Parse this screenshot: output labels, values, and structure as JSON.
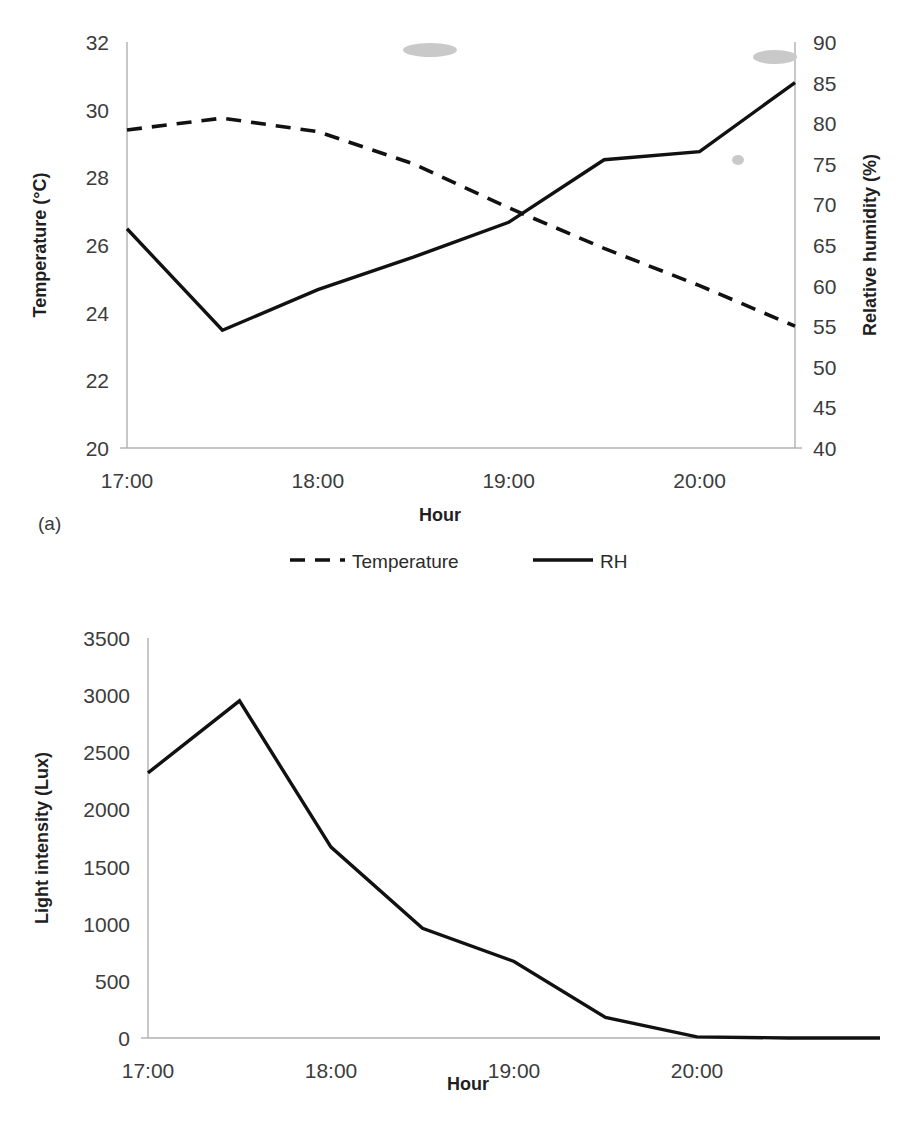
{
  "figure": {
    "panel_a_label": "(a)",
    "panel_b_label": "(b)"
  },
  "chart_data": [
    {
      "id": "chart-a",
      "type": "line",
      "title": "",
      "xlabel": "Hour",
      "ylabel": "Temperature (°C)",
      "y2label": "Relative humidity (%)",
      "x": [
        "17:00",
        "17:30",
        "18:00",
        "18:30",
        "19:00",
        "19:30",
        "20:00",
        "20:30"
      ],
      "xlim": [
        17.0,
        20.5
      ],
      "xticks": [
        "17:00",
        "18:00",
        "19:00",
        "20:00"
      ],
      "xtick_values": [
        17,
        18,
        19,
        20
      ],
      "ylim": [
        20,
        32
      ],
      "yticks": [
        20,
        22,
        24,
        26,
        28,
        30,
        32
      ],
      "y2lim": [
        40,
        90
      ],
      "y2ticks": [
        40,
        45,
        50,
        55,
        60,
        65,
        70,
        75,
        80,
        85,
        90
      ],
      "grid": false,
      "legend_position": "bottom",
      "series": [
        {
          "name": "Temperature",
          "axis": "left",
          "style": "dashed",
          "values": [
            29.4,
            29.75,
            29.35,
            28.4,
            27.1,
            25.9,
            24.8,
            23.6
          ]
        },
        {
          "name": "RH",
          "axis": "right",
          "style": "solid",
          "values": [
            67.0,
            54.5,
            59.5,
            63.5,
            67.8,
            75.5,
            76.5,
            85.0
          ]
        }
      ]
    },
    {
      "id": "chart-b",
      "type": "line",
      "title": "",
      "xlabel": "Hour",
      "ylabel": "Light intensity (Lux)",
      "x": [
        "17:00",
        "17:30",
        "18:00",
        "18:30",
        "19:00",
        "19:30",
        "20:00",
        "20:30",
        "21:00"
      ],
      "xlim": [
        17.0,
        21.0
      ],
      "xticks": [
        "17:00",
        "18:00",
        "19:00",
        "20:00"
      ],
      "xtick_values": [
        17,
        18,
        19,
        20
      ],
      "ylim": [
        0,
        3500
      ],
      "yticks": [
        0,
        500,
        1000,
        1500,
        2000,
        2500,
        3000,
        3500
      ],
      "grid": false,
      "legend_position": "none",
      "series": [
        {
          "name": "Light intensity",
          "axis": "left",
          "style": "solid",
          "values": [
            2320,
            2950,
            1670,
            960,
            670,
            180,
            10,
            0,
            0
          ]
        }
      ]
    }
  ]
}
